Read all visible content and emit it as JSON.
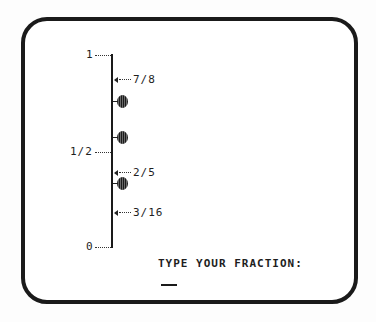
{
  "screen": {
    "frame_color": "#1a1a1a",
    "background": "#ffffff"
  },
  "number_line": {
    "top_label": "1",
    "middle_label": "1/2",
    "bottom_label": "0",
    "markers": [
      {
        "label": "7/8",
        "type": "pointer"
      },
      {
        "label": "",
        "type": "blob"
      },
      {
        "label": "",
        "type": "blob"
      },
      {
        "label": "2/5",
        "type": "pointer"
      },
      {
        "label": "",
        "type": "blob"
      },
      {
        "label": "3/16",
        "type": "pointer"
      }
    ]
  },
  "prompt": {
    "text": "TYPE YOUR FRACTION:",
    "input_value": ""
  }
}
